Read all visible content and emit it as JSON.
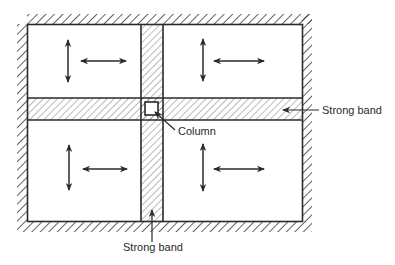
{
  "diagram": {
    "type": "structural-plan",
    "labels": {
      "strong_band_right": "Strong band",
      "strong_band_bottom": "Strong band",
      "column": "Column"
    },
    "panels": [
      {
        "id": "top-left",
        "arrows": [
          "vertical",
          "horizontal"
        ]
      },
      {
        "id": "top-right",
        "arrows": [
          "vertical",
          "horizontal"
        ]
      },
      {
        "id": "bottom-left",
        "arrows": [
          "vertical",
          "horizontal"
        ]
      },
      {
        "id": "bottom-right",
        "arrows": [
          "vertical",
          "horizontal"
        ]
      }
    ],
    "colors": {
      "line": "#2a2a2a",
      "hatch": "#3a3a3a",
      "background": "#ffffff"
    }
  }
}
